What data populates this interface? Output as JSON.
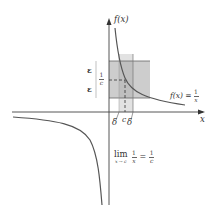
{
  "diagram": {
    "type": "epsilon-delta limit illustration",
    "function_label": "f(x) = 1/x",
    "y_axis_label": "f(x)",
    "x_axis_label": "x",
    "point_label": "c",
    "value_label": "1/c",
    "epsilon_label": "ε",
    "delta_label": "δ",
    "limit_expression": {
      "lim": "lim",
      "subscript": "x → c",
      "lhs_num": "1",
      "lhs_den": "x",
      "equals": "=",
      "rhs_num": "1",
      "rhs_den": "c"
    },
    "function_expression": {
      "lhs": "f(x) =",
      "num": "1",
      "den": "x"
    },
    "colors": {
      "axis": "#444444",
      "curve": "#555555",
      "epsilon_band": "#c8c8c8",
      "delta_band": "#e0e0e0",
      "overlap": "#b8b8b8",
      "dashed": "#333333",
      "text": "#333333"
    }
  }
}
